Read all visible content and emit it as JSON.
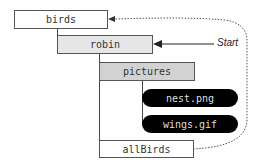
{
  "nodes": {
    "birds": "birds",
    "robin": "robin",
    "pictures": "pictures",
    "nest": "nest.png",
    "wings": "wings.gif",
    "allBirds": "allBirds"
  },
  "annotation": {
    "start_label": "Start"
  }
}
